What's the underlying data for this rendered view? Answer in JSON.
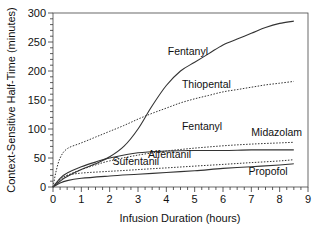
{
  "chart_data": {
    "type": "line",
    "title": "",
    "xlabel": "Infusion Duration (hours)",
    "ylabel": "Context-Sensitive Half-Time (minutes)",
    "xlim": [
      0,
      9
    ],
    "ylim": [
      0,
      300
    ],
    "xticks": [
      0,
      1,
      2,
      3,
      4,
      5,
      6,
      7,
      8,
      9
    ],
    "yticks": [
      0,
      50,
      100,
      150,
      200,
      250,
      300
    ],
    "grid": false,
    "legend": "inline labels",
    "series": [
      {
        "name": "Fentanyl",
        "style": "solid",
        "x": [
          0,
          0.25,
          0.5,
          1,
          1.5,
          2,
          2.5,
          3,
          3.5,
          4,
          4.5,
          5,
          5.5,
          6,
          6.5,
          7,
          7.5,
          8,
          8.5
        ],
        "y": [
          0,
          10,
          18,
          30,
          40,
          52,
          70,
          100,
          140,
          175,
          200,
          215,
          230,
          245,
          255,
          265,
          275,
          282,
          286
        ],
        "label": {
          "text": "Fentanyl",
          "x": 4.05,
          "y": 228
        }
      },
      {
        "name": "Thiopental",
        "style": "dotted",
        "x": [
          0,
          0.1,
          0.25,
          0.5,
          1,
          1.5,
          2,
          2.5,
          3,
          3.5,
          4,
          4.5,
          5,
          5.5,
          6,
          6.5,
          7,
          7.5,
          8,
          8.5
        ],
        "y": [
          0,
          25,
          50,
          66,
          76,
          86,
          96,
          106,
          117,
          127,
          136,
          145,
          152,
          158,
          164,
          168,
          172,
          176,
          179,
          182
        ],
        "label": {
          "text": "Thiopental",
          "x": 4.55,
          "y": 170
        }
      },
      {
        "name": "Midazolam",
        "style": "dotted",
        "x": [
          0,
          0.25,
          0.5,
          1,
          1.5,
          2,
          3,
          4,
          5,
          6,
          7,
          8,
          8.5
        ],
        "y": [
          0,
          12,
          20,
          30,
          38,
          45,
          55,
          62,
          67,
          71,
          74,
          76,
          77
        ],
        "label": {
          "text": "Midazolam",
          "x": 7.0,
          "y": 88
        }
      },
      {
        "name": "Alfentanil",
        "style": "solid",
        "x": [
          0,
          0.25,
          0.5,
          1,
          1.5,
          2,
          3,
          4,
          5,
          6,
          7,
          8,
          8.5
        ],
        "y": [
          0,
          15,
          24,
          35,
          43,
          50,
          59,
          62,
          63,
          63,
          64,
          64,
          64
        ],
        "label": {
          "text": "Alfentanil",
          "x": 3.35,
          "y": 50
        }
      },
      {
        "name": "Sufentanil",
        "style": "dotted",
        "x": [
          0,
          0.25,
          0.5,
          1,
          2,
          3,
          4,
          5,
          6,
          7,
          8,
          8.5
        ],
        "y": [
          0,
          14,
          20,
          24,
          27,
          30,
          33,
          36,
          39,
          42,
          45,
          47
        ],
        "label": {
          "text": "Sufentanil",
          "x": 2.1,
          "y": 38
        }
      },
      {
        "name": "Propofol",
        "style": "solid",
        "x": [
          0,
          0.25,
          0.5,
          1,
          2,
          3,
          4,
          5,
          6,
          7,
          8,
          8.5
        ],
        "y": [
          0,
          7,
          11,
          15,
          19,
          22,
          25,
          28,
          32,
          35,
          38,
          40
        ],
        "label": {
          "text": "Propofol",
          "x": 6.9,
          "y": 20
        }
      }
    ],
    "annotations": [
      {
        "text": "Fentanyl",
        "x": 4.55,
        "y": 98,
        "note": "second Fentanyl label between Thiopental and Midazolam"
      }
    ]
  },
  "colors": {
    "line": "#333333",
    "axis": "#222222",
    "background": "#ffffff"
  }
}
